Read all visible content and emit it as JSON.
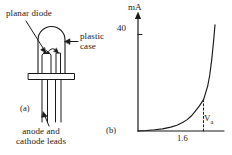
{
  "figure": {
    "type": "two-panel-textbook-figure",
    "background_color": "#ffffff",
    "ink_color": "#1a1a1a"
  },
  "panel_a": {
    "caption": "(a)",
    "title": "LED / planar diode construction",
    "callouts": [
      {
        "name": "planar-diode",
        "text": "planar diode"
      },
      {
        "name": "plastic-case",
        "line1": "plastic",
        "line2": "case"
      },
      {
        "name": "anode-cathode-leads",
        "line1": "anode and",
        "line2": "cathode leads"
      }
    ],
    "parts": [
      "dome-top plastic case",
      "reflector cup with diode die",
      "bond wire",
      "flange",
      "two parallel leads"
    ]
  },
  "panel_b": {
    "caption": "(b)",
    "y_axis_label": "mA",
    "y_tick_label": "40",
    "x_axis_label": "V",
    "x_axis_label_sub": "a",
    "x_marker_label": "1.6",
    "marker_style": "dashed-vertical-line"
  },
  "chart_data": {
    "type": "line",
    "title": "",
    "subtitle": "",
    "xlabel": "Va",
    "ylabel": "mA",
    "xlim": [
      0,
      2.1
    ],
    "ylim": [
      0,
      46
    ],
    "grid": false,
    "legend": null,
    "y_ticks": [
      40
    ],
    "y_ticklabels": [
      "40"
    ],
    "x_ticks": [
      1.6
    ],
    "x_ticklabels": [
      "1.6"
    ],
    "annotations": [
      {
        "name": "knee-marker",
        "text": "1.6",
        "x": 1.6,
        "y": 13,
        "style": "dashed vertical line from x-axis up to the curve"
      }
    ],
    "series": [
      {
        "name": "forward diode current",
        "x": [
          0.0,
          0.2,
          0.4,
          0.6,
          0.8,
          0.95,
          1.1,
          1.2,
          1.3,
          1.4,
          1.5,
          1.6,
          1.7,
          1.75,
          1.8,
          1.85,
          1.88
        ],
        "values": [
          0.0,
          0.2,
          0.5,
          0.9,
          1.6,
          2.4,
          3.6,
          4.7,
          6.2,
          8.2,
          10.4,
          13.0,
          18.5,
          23.0,
          29.5,
          38.0,
          44.0
        ]
      }
    ]
  }
}
